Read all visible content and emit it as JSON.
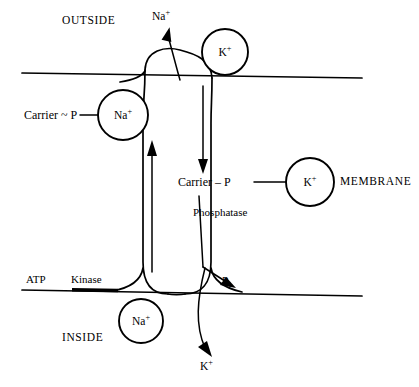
{
  "figure": {
    "title_region": "sodium-potassium pump membrane transport diagram",
    "compartments": {
      "outside_label": "OUTSIDE",
      "inside_label": "INSIDE",
      "membrane_label": "MEMBRANE"
    },
    "ions": {
      "sodium": "Na",
      "sodium_charge": "+",
      "potassium": "K",
      "potassium_charge": "+",
      "phosphate": "P",
      "phosphate_sub": "i"
    },
    "carrier_states": {
      "energized": "Carrier ~ P",
      "dephosphorylating": "Carrier – P"
    },
    "enzymes": {
      "kinase": "Kinase",
      "phosphatase": "Phosphatase"
    },
    "substrates": {
      "atp": "ATP"
    },
    "circles": [
      {
        "id": "na-bound-outside",
        "label": "Na",
        "charge": "+",
        "cx": 123,
        "cy": 115,
        "r": 25
      },
      {
        "id": "k-outside",
        "label": "K",
        "charge": "+",
        "cx": 225,
        "cy": 52,
        "r": 23
      },
      {
        "id": "k-membrane-bound",
        "label": "K",
        "charge": "+",
        "cx": 310,
        "cy": 182,
        "r": 24
      },
      {
        "id": "na-inside",
        "label": "Na",
        "charge": "+",
        "cx": 141,
        "cy": 321,
        "r": 22
      }
    ],
    "colors": {
      "ink": "#000000",
      "paper": "#ffffff"
    }
  }
}
